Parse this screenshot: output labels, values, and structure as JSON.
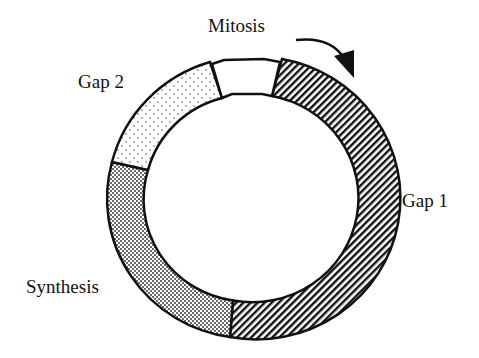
{
  "diagram": {
    "phases": [
      {
        "name": "Mitosis",
        "label": "Mitosis",
        "pattern": "blank"
      },
      {
        "name": "Gap 1",
        "label": "Gap 1",
        "pattern": "diagonal-hatch"
      },
      {
        "name": "Synthesis",
        "label": "Synthesis",
        "pattern": "dense-dots"
      },
      {
        "name": "Gap 2",
        "label": "Gap 2",
        "pattern": "sparse-dots"
      }
    ],
    "direction": "clockwise",
    "arrow_icon": "curved-arrow-clockwise"
  }
}
